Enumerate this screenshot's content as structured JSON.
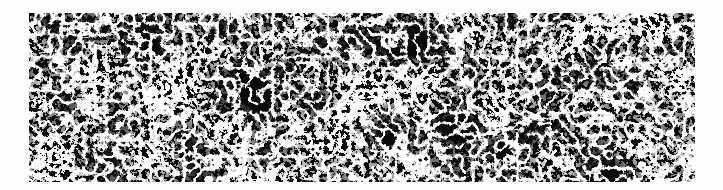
{
  "image": {
    "description": "Cosmic-web style filament texture: dense network of bright white interconnected strands on a black background",
    "background_color": "#fdfdfd",
    "panel_color": "#0a0a0a",
    "filament_color": "#ffffff",
    "panel": {
      "x": 29,
      "y": 13,
      "width": 666,
      "height": 169
    }
  }
}
